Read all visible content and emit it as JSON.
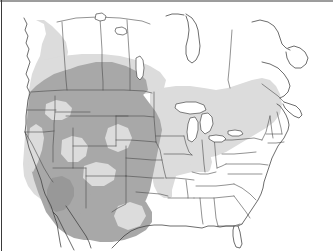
{
  "figure": {
    "type": "thematic-range-map",
    "title": "",
    "region": "North America (contiguous United States, southern Canada, northern Mexico)",
    "projection_hint": "conic",
    "background_color": "#ffffff",
    "width": 333,
    "height": 251,
    "frame": {
      "top_edge": true,
      "left_edge": true,
      "right_edge": false,
      "bottom_edge": false,
      "color": "#3a3a3a"
    }
  },
  "colors": {
    "background": "#ffffff",
    "shade_none": "#ffffff",
    "shade_light": "#dcdcdc",
    "shade_medium": "#a8a8a8",
    "shade_dark": "#989898",
    "boundary_line": "#4a4a4a",
    "coast_line": "#3c3c3c",
    "frame_line": "#3a3a3a"
  },
  "legend": {
    "visible": false,
    "classes": [
      {
        "key": "shade_dark",
        "label": "",
        "color": "#989898",
        "order": 3
      },
      {
        "key": "shade_medium",
        "label": "",
        "color": "#a8a8a8",
        "order": 2
      },
      {
        "key": "shade_light",
        "label": "",
        "color": "#dcdcdc",
        "order": 1
      },
      {
        "key": "shade_none",
        "label": "",
        "color": "#ffffff",
        "order": 0
      }
    ]
  },
  "shaded_regions": [
    {
      "name": "pacific-northwest-coastal-band",
      "class": "shade_light",
      "description": "Light band along British Columbia and Washington coast"
    },
    {
      "name": "northern-plains-prairie-provinces",
      "class": "shade_light",
      "description": "Light shading across southern Alberta, Saskatchewan and Manitoba"
    },
    {
      "name": "western-interior-core",
      "class": "shade_medium",
      "description": "Medium shading covering the Intermountain West, Rockies and Great Plains"
    },
    {
      "name": "arizona-interior-patch",
      "class": "shade_dark",
      "description": "Darker patch over central and southern Arizona"
    },
    {
      "name": "great-lakes-and-northeast",
      "class": "shade_light",
      "description": "Light shading over the Great Lakes states, Appalachians and New England"
    },
    {
      "name": "mid-south-transition",
      "class": "shade_light",
      "description": "Light shading through the lower Mississippi valley and mid-south"
    },
    {
      "name": "southeast-coastal-plain",
      "class": "shade_none",
      "description": "Unshaded Gulf coastal plain and Florida peninsula"
    },
    {
      "name": "central-valley-gap",
      "class": "shade_light",
      "description": "Light interior streaks through California Central Valley and western river corridors"
    }
  ],
  "map_features": {
    "shows_state_boundaries": true,
    "shows_province_boundaries": true,
    "shows_coastlines": true,
    "shows_great_lakes": true,
    "shows_graticule": false,
    "labels": []
  }
}
